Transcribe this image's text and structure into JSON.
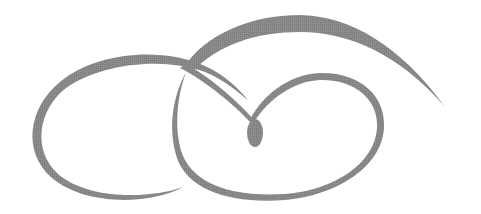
{
  "image": {
    "description": "Decorative calligraphic flourish ornament",
    "width": 481,
    "height": 214,
    "background": "#ffffff",
    "stroke_color": "#858585",
    "elements": [
      {
        "name": "left-loop",
        "kind": "swirl"
      },
      {
        "name": "top-arc-swoosh",
        "kind": "tapered-arc"
      },
      {
        "name": "right-loop",
        "kind": "swirl"
      },
      {
        "name": "center-teardrop",
        "kind": "drop"
      }
    ]
  }
}
